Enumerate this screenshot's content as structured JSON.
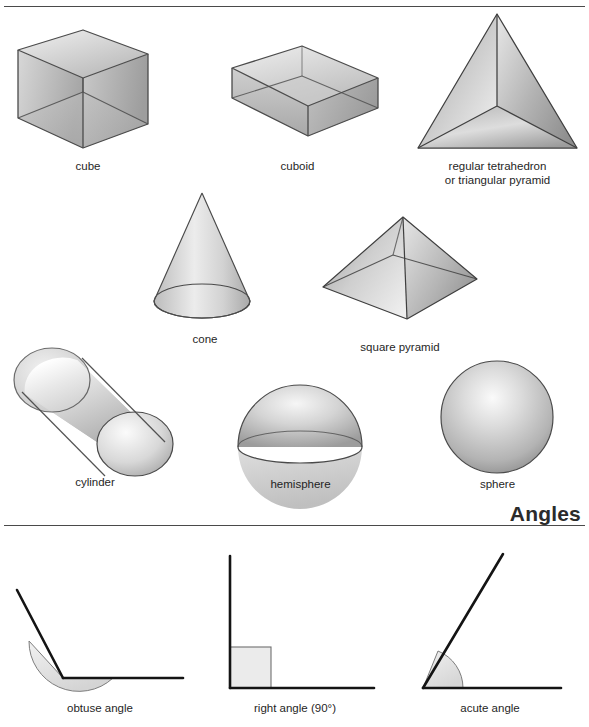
{
  "page": {
    "background_color": "#ffffff",
    "rule_color": "#4a4a4a",
    "outline_color": "#3a3a3a",
    "label_color": "#1f1f1f"
  },
  "solids_section": {
    "shapes": [
      {
        "id": "cube",
        "label": "cube",
        "icon": "cube-icon"
      },
      {
        "id": "cuboid",
        "label": "cuboid",
        "icon": "cuboid-icon"
      },
      {
        "id": "tetrahedron",
        "label": "regular tetrahedron\nor triangular pyramid",
        "icon": "tetrahedron-icon"
      },
      {
        "id": "cone",
        "label": "cone",
        "icon": "cone-icon"
      },
      {
        "id": "square-pyramid",
        "label": "square pyramid",
        "icon": "square-pyramid-icon"
      },
      {
        "id": "cylinder",
        "label": "cylinder",
        "icon": "cylinder-icon"
      },
      {
        "id": "hemisphere",
        "label": "hemisphere",
        "icon": "hemisphere-icon"
      },
      {
        "id": "sphere",
        "label": "sphere",
        "icon": "sphere-icon"
      }
    ]
  },
  "angles_section": {
    "heading": "Angles",
    "shapes": [
      {
        "id": "obtuse-angle",
        "label": "obtuse angle",
        "icon": "obtuse-angle-icon"
      },
      {
        "id": "right-angle",
        "label": "right angle (90°)",
        "icon": "right-angle-icon"
      },
      {
        "id": "acute-angle",
        "label": "acute angle",
        "icon": "acute-angle-icon"
      }
    ]
  }
}
